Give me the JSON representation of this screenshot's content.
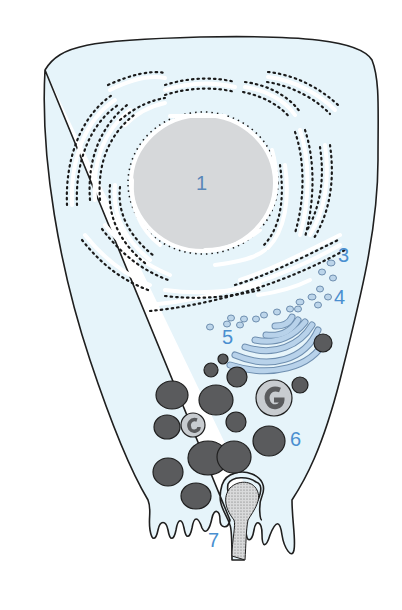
{
  "diagram": {
    "colors": {
      "cytoplasm": "#e6f4fa",
      "outline": "#1f1f1f",
      "nucleus": "#d6d8da",
      "label": "#4a8fd0",
      "granule": "#5a5b5d",
      "golgi": "#b8d2ea",
      "vesicle": "#bcd5ea",
      "ribosome": "#1a1a1a"
    },
    "labels": [
      {
        "id": "1",
        "text": "1",
        "part": "nucleus"
      },
      {
        "id": "3",
        "text": "3",
        "part": "rough-endoplasmic-reticulum"
      },
      {
        "id": "4",
        "text": "4",
        "part": "transport-vesicles"
      },
      {
        "id": "5",
        "text": "5",
        "part": "golgi-apparatus"
      },
      {
        "id": "6",
        "text": "6",
        "part": "secretory-granules"
      },
      {
        "id": "7",
        "text": "7",
        "part": "exocytosis"
      }
    ]
  }
}
